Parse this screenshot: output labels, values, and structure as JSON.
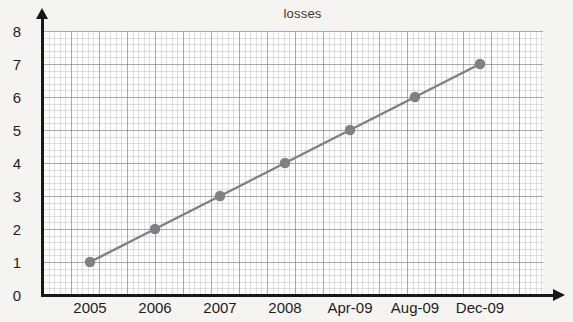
{
  "chart_data": {
    "type": "line",
    "title": "losses",
    "xlabel": "",
    "ylabel": "",
    "categories": [
      "2005",
      "2006",
      "2007",
      "2008",
      "Apr-09",
      "Aug-09",
      "Dec-09"
    ],
    "values": [
      1,
      2,
      3,
      4,
      5,
      6,
      7
    ],
    "series": [
      {
        "name": "losses",
        "values": [
          1,
          2,
          3,
          4,
          5,
          6,
          7
        ]
      }
    ],
    "y_ticks": [
      "0",
      "1",
      "2",
      "3",
      "4",
      "5",
      "6",
      "7",
      "8"
    ],
    "ylim": [
      0,
      8
    ],
    "grid": true,
    "grid_style": "graph-paper",
    "legend": "none",
    "marker": "filled-circle",
    "colors": {
      "line": "#7e8086",
      "marker": "#7e8086",
      "axis": "#17171a",
      "text": "#1d1d1f",
      "background": "#f6f4f1",
      "plot_background": "#fdfdfc",
      "grid_major": "#787d87",
      "grid_minor": "#969ba5"
    }
  }
}
